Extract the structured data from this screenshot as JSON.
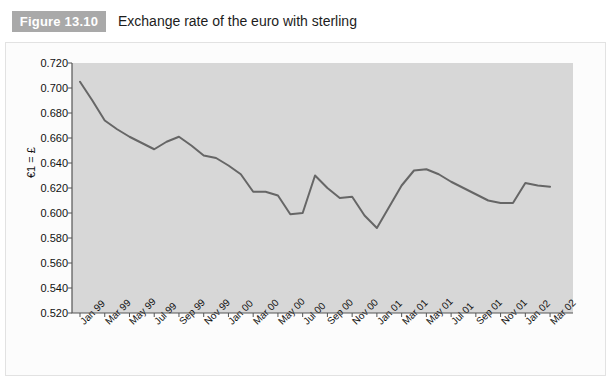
{
  "figure": {
    "badge": "Figure 13.10",
    "title": "Exchange rate of the euro with sterling"
  },
  "colors": {
    "badge_bg": "#a9a9a9",
    "badge_text": "#ffffff",
    "plot_bg": "#d7d7d7",
    "line": "#666666",
    "axis": "#555555",
    "panel_bg": "#fcfcfc",
    "text": "#111111"
  },
  "chart_data": {
    "type": "line",
    "title": "Exchange rate of the euro with sterling",
    "xlabel": "",
    "ylabel": "€1 = £",
    "ylim": [
      0.52,
      0.72
    ],
    "ytick_step": 0.02,
    "ytick_labels": [
      "0.720",
      "0.700",
      "0.680",
      "0.660",
      "0.640",
      "0.620",
      "0.600",
      "0.580",
      "0.560",
      "0.540",
      "0.520"
    ],
    "ytick_values": [
      0.72,
      0.7,
      0.68,
      0.66,
      0.64,
      0.62,
      0.6,
      0.58,
      0.56,
      0.54,
      0.52
    ],
    "grid": false,
    "legend": null,
    "x_tick_labels": [
      "Jan 99",
      "Mar 99",
      "May 99",
      "Jul 99",
      "Sep 99",
      "Nov 99",
      "Jan 00",
      "Mar 00",
      "May 00",
      "Jul 00",
      "Sep 00",
      "Nov 00",
      "Jan 01",
      "Mar 01",
      "May 01",
      "Jul 01",
      "Sep 01",
      "Nov 01",
      "Jan 02",
      "Mar 02"
    ],
    "x": [
      "Jan 99",
      "Feb 99",
      "Mar 99",
      "Apr 99",
      "May 99",
      "Jun 99",
      "Jul 99",
      "Aug 99",
      "Sep 99",
      "Oct 99",
      "Nov 99",
      "Dec 99",
      "Jan 00",
      "Feb 00",
      "Mar 00",
      "Apr 00",
      "May 00",
      "Jun 00",
      "Jul 00",
      "Aug 00",
      "Sep 00",
      "Oct 00",
      "Nov 00",
      "Dec 00",
      "Jan 01",
      "Feb 01",
      "Mar 01",
      "Apr 01",
      "May 01",
      "Jun 01",
      "Jul 01",
      "Aug 01",
      "Sep 01",
      "Oct 01",
      "Nov 01",
      "Dec 01",
      "Jan 02",
      "Feb 02",
      "Mar 02"
    ],
    "values": [
      0.705,
      0.69,
      0.674,
      0.667,
      0.661,
      0.656,
      0.651,
      0.657,
      0.661,
      0.654,
      0.646,
      0.644,
      0.638,
      0.631,
      0.617,
      0.617,
      0.614,
      0.599,
      0.6,
      0.63,
      0.62,
      0.612,
      0.613,
      0.598,
      0.588,
      0.605,
      0.622,
      0.634,
      0.635,
      0.631,
      0.625,
      0.62,
      0.615,
      0.61,
      0.608,
      0.608,
      0.624,
      0.622,
      0.621
    ],
    "series": [
      {
        "name": "€1 = £",
        "values": [
          0.705,
          0.69,
          0.674,
          0.667,
          0.661,
          0.656,
          0.651,
          0.657,
          0.661,
          0.654,
          0.646,
          0.644,
          0.638,
          0.631,
          0.617,
          0.617,
          0.614,
          0.599,
          0.6,
          0.63,
          0.62,
          0.612,
          0.613,
          0.598,
          0.588,
          0.605,
          0.622,
          0.634,
          0.635,
          0.631,
          0.625,
          0.62,
          0.615,
          0.61,
          0.608,
          0.608,
          0.624,
          0.622,
          0.621
        ]
      }
    ]
  }
}
